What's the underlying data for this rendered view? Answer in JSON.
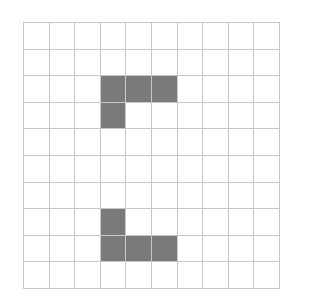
{
  "grid": {
    "rows": 10,
    "cols": 10,
    "line_color": "#c8c8c8",
    "fill_color": "#7a7a7a",
    "filled_cells": [
      [
        2,
        3
      ],
      [
        2,
        4
      ],
      [
        2,
        5
      ],
      [
        3,
        3
      ],
      [
        7,
        3
      ],
      [
        8,
        3
      ],
      [
        8,
        4
      ],
      [
        8,
        5
      ]
    ]
  }
}
